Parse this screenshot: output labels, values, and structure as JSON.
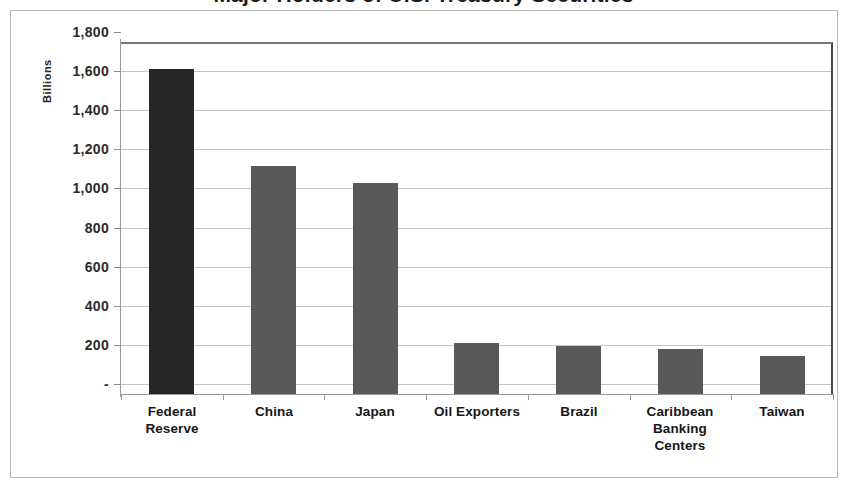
{
  "title": {
    "text": "Major Holders of U.S. Treasury Securities"
  },
  "axis": {
    "y_title": "Billions",
    "y_ticks": [
      "1,800",
      "1,600",
      "1,400",
      "1,200",
      "1,000",
      "800",
      "600",
      "400",
      "200",
      "-"
    ]
  },
  "colors": {
    "highlight_bar": "#262626",
    "bar": "#595959",
    "gridline": "#c6c6c6",
    "axis": "#9a9a9a",
    "frame": "#b9b9b9",
    "plot_border": "#4a4a4a",
    "text": "#161616"
  },
  "chart_data": {
    "type": "bar",
    "title": "Major Holders of U.S. Treasury Securities",
    "xlabel": "",
    "ylabel": "Billions",
    "ylim": [
      0,
      1800
    ],
    "ytick_values": [
      0,
      200,
      400,
      600,
      800,
      1000,
      1200,
      1400,
      1600,
      1800
    ],
    "ytick_labels": [
      "-",
      "200",
      "400",
      "600",
      "800",
      "1,000",
      "1,200",
      "1,400",
      "1,600",
      "1,800"
    ],
    "grid": true,
    "legend": false,
    "categories": [
      "Federal Reserve",
      "China",
      "Japan",
      "Oil Exporters",
      "Brazil",
      "Caribbean Banking Centers",
      "Taiwan"
    ],
    "category_lines": [
      [
        "Federal",
        "Reserve"
      ],
      [
        "China"
      ],
      [
        "Japan"
      ],
      [
        "Oil Exporters"
      ],
      [
        "Brazil"
      ],
      [
        "Caribbean",
        "Banking",
        "Centers"
      ],
      [
        "Taiwan"
      ]
    ],
    "values": [
      1660,
      1168,
      1078,
      260,
      245,
      228,
      195
    ],
    "bar_colors": [
      "#262626",
      "#595959",
      "#595959",
      "#595959",
      "#595959",
      "#595959",
      "#595959"
    ]
  }
}
